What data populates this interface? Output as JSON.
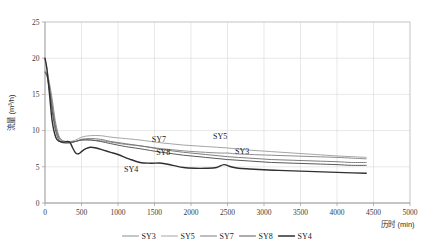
{
  "chart_data": {
    "type": "line",
    "title": "",
    "subtitle": "",
    "xlabel": "历时 (min)",
    "ylabel": "流量 (m³/h)",
    "xlim": [
      0,
      5000
    ],
    "ylim": [
      0,
      25
    ],
    "xticks": [
      0,
      500,
      1000,
      1500,
      2000,
      2500,
      3000,
      3500,
      4000,
      4500,
      5000
    ],
    "yticks": [
      0,
      5,
      10,
      15,
      20,
      25
    ],
    "xtick_labels": [
      "0",
      "500",
      "1000",
      "1500",
      "2000",
      "2500",
      "3000",
      "3500",
      "4000",
      "4500",
      "5000"
    ],
    "ytick_labels": [
      "0",
      "5",
      "10",
      "15",
      "20",
      "25"
    ],
    "grid": true,
    "legend_position": "bottom",
    "legend_entries": [
      "SY3",
      "SY5",
      "SY7",
      "SY8",
      "SY4"
    ],
    "series": [
      {
        "name": "SY3",
        "color": "#808080",
        "width": 0.9,
        "label_annotation": "SY3",
        "x": [
          0,
          30,
          60,
          100,
          140,
          180,
          220,
          280,
          350,
          420,
          500,
          620,
          760,
          900,
          1100,
          1300,
          1600,
          1900,
          2200,
          2400,
          2500,
          2600,
          2800,
          3100,
          3400,
          3700,
          4000,
          4200,
          4400
        ],
        "y": [
          18.2,
          17.8,
          16.6,
          14.2,
          11.4,
          9.6,
          8.8,
          8.5,
          8.4,
          8.5,
          8.7,
          8.7,
          8.6,
          8.4,
          8.1,
          7.9,
          7.5,
          7.2,
          7.0,
          6.9,
          6.9,
          6.8,
          6.7,
          6.6,
          6.5,
          6.4,
          6.3,
          6.2,
          6.1
        ]
      },
      {
        "name": "SY5",
        "color": "#9b9b9b",
        "width": 0.9,
        "label_annotation": "SY5",
        "x": [
          0,
          30,
          60,
          100,
          140,
          180,
          220,
          280,
          350,
          420,
          500,
          620,
          760,
          900,
          1100,
          1300,
          1600,
          1900,
          2200,
          2500,
          2800,
          3100,
          3400,
          3700,
          4000,
          4200,
          4400
        ],
        "y": [
          19.9,
          18.4,
          16.2,
          13.0,
          10.6,
          9.2,
          8.7,
          8.5,
          8.5,
          8.7,
          9.1,
          9.3,
          9.3,
          9.1,
          8.9,
          8.7,
          8.3,
          8.0,
          7.8,
          7.6,
          7.3,
          7.1,
          6.9,
          6.7,
          6.5,
          6.4,
          6.3
        ]
      },
      {
        "name": "SY7",
        "color": "#6e6e6e",
        "width": 0.9,
        "label_annotation": "SY7",
        "x": [
          0,
          30,
          60,
          100,
          140,
          180,
          220,
          280,
          350,
          420,
          500,
          620,
          760,
          900,
          1100,
          1300,
          1600,
          1900,
          2200,
          2500,
          2800,
          3100,
          3400,
          3700,
          4000,
          4200,
          4400
        ],
        "y": [
          18.1,
          17.6,
          16.1,
          13.4,
          10.8,
          9.3,
          8.6,
          8.3,
          8.3,
          8.5,
          8.8,
          8.9,
          8.8,
          8.5,
          8.2,
          7.9,
          7.4,
          7.0,
          6.7,
          6.4,
          6.2,
          6.0,
          5.9,
          5.8,
          5.7,
          5.6,
          5.6
        ]
      },
      {
        "name": "SY8",
        "color": "#595959",
        "width": 1.0,
        "label_annotation": "SY8",
        "x": [
          0,
          30,
          60,
          100,
          140,
          180,
          220,
          280,
          350,
          420,
          500,
          620,
          760,
          900,
          1100,
          1300,
          1600,
          1900,
          2200,
          2500,
          2800,
          3100,
          3400,
          3700,
          4000,
          4200,
          4400
        ],
        "y": [
          18.0,
          17.4,
          15.6,
          12.6,
          10.2,
          8.9,
          8.4,
          8.3,
          8.4,
          8.5,
          8.7,
          8.7,
          8.5,
          8.2,
          7.8,
          7.5,
          7.0,
          6.6,
          6.3,
          6.0,
          5.8,
          5.6,
          5.5,
          5.4,
          5.3,
          5.2,
          5.2
        ]
      },
      {
        "name": "SY4",
        "color": "#2f2f2f",
        "width": 1.4,
        "label_annotation": "SY4",
        "x": [
          0,
          25,
          60,
          100,
          150,
          200,
          250,
          300,
          340,
          380,
          420,
          460,
          500,
          560,
          620,
          700,
          800,
          900,
          1000,
          1150,
          1300,
          1450,
          1600,
          1750,
          1900,
          2050,
          2200,
          2350,
          2450,
          2550,
          2650,
          2800,
          3000,
          3200,
          3500,
          3800,
          4100,
          4400
        ],
        "y": [
          20.0,
          18.6,
          15.2,
          11.2,
          9.0,
          8.5,
          8.4,
          8.5,
          8.4,
          7.6,
          6.9,
          6.8,
          7.1,
          7.5,
          7.7,
          7.6,
          7.3,
          7.0,
          6.7,
          6.1,
          5.6,
          5.5,
          5.5,
          5.2,
          4.9,
          4.8,
          4.8,
          4.9,
          5.3,
          5.0,
          4.8,
          4.7,
          4.6,
          4.5,
          4.4,
          4.3,
          4.2,
          4.1
        ]
      }
    ],
    "annotations": [
      {
        "text": "SY7",
        "x": 1560,
        "y": 8.4
      },
      {
        "text": "SY5",
        "x": 2400,
        "y": 8.9
      },
      {
        "text": "SY8",
        "x": 1620,
        "y": 6.6
      },
      {
        "text": "SY3",
        "x": 2700,
        "y": 6.7
      },
      {
        "text": "SY4",
        "x": 1180,
        "y": 4.3
      }
    ]
  }
}
